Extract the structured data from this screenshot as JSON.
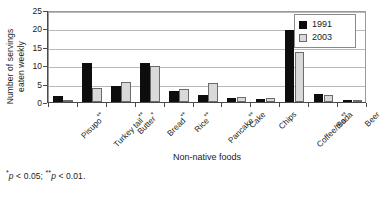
{
  "chart_data": {
    "type": "bar",
    "title": "",
    "xlabel": "Non-native foods",
    "ylabel": "Number of servings\neaten weekly",
    "ylim": [
      0,
      25
    ],
    "yticks": [
      0,
      5,
      10,
      15,
      20,
      25
    ],
    "grid": true,
    "legend_position": "top-right",
    "categories": [
      "Pisupo**",
      "Turkey tail**",
      "Butter*",
      "Bread**",
      "Rice**",
      "Pancake**",
      "Cake",
      "Chips",
      "Coffee/tea**",
      "Soda",
      "Beer"
    ],
    "category_names": [
      "Pisupo",
      "Turkey tail",
      "Butter",
      "Bread",
      "Rice",
      "Pancake",
      "Cake",
      "Chips",
      "Coffee/tea",
      "Soda",
      "Beer"
    ],
    "category_significance": [
      "**",
      "**",
      "*",
      "**",
      "**",
      "**",
      "",
      "",
      "**",
      "",
      ""
    ],
    "series": [
      {
        "name": "1991",
        "color": "#0d0d0d",
        "values": [
          1.7,
          10.7,
          4.4,
          10.7,
          3.1,
          2.0,
          1.0,
          0.9,
          19.7,
          2.2,
          0.05
        ]
      },
      {
        "name": "2003",
        "color": "#d9d9d9",
        "values": [
          0.4,
          3.7,
          5.5,
          9.9,
          3.5,
          5.3,
          1.3,
          1.1,
          13.6,
          1.9,
          0.05
        ]
      }
    ]
  },
  "legend": {
    "items": [
      {
        "label": "1991",
        "color": "#0d0d0d"
      },
      {
        "label": "2003",
        "color": "#d9d9d9"
      }
    ]
  },
  "footnote": {
    "star1": "*",
    "text1": "p",
    "value1": " < 0.05; ",
    "star2": "**",
    "text2": "p",
    "value2": " < 0.01."
  },
  "axes": {
    "y_title": "Number of servings\neaten weekly",
    "x_title": "Non-native foods"
  }
}
